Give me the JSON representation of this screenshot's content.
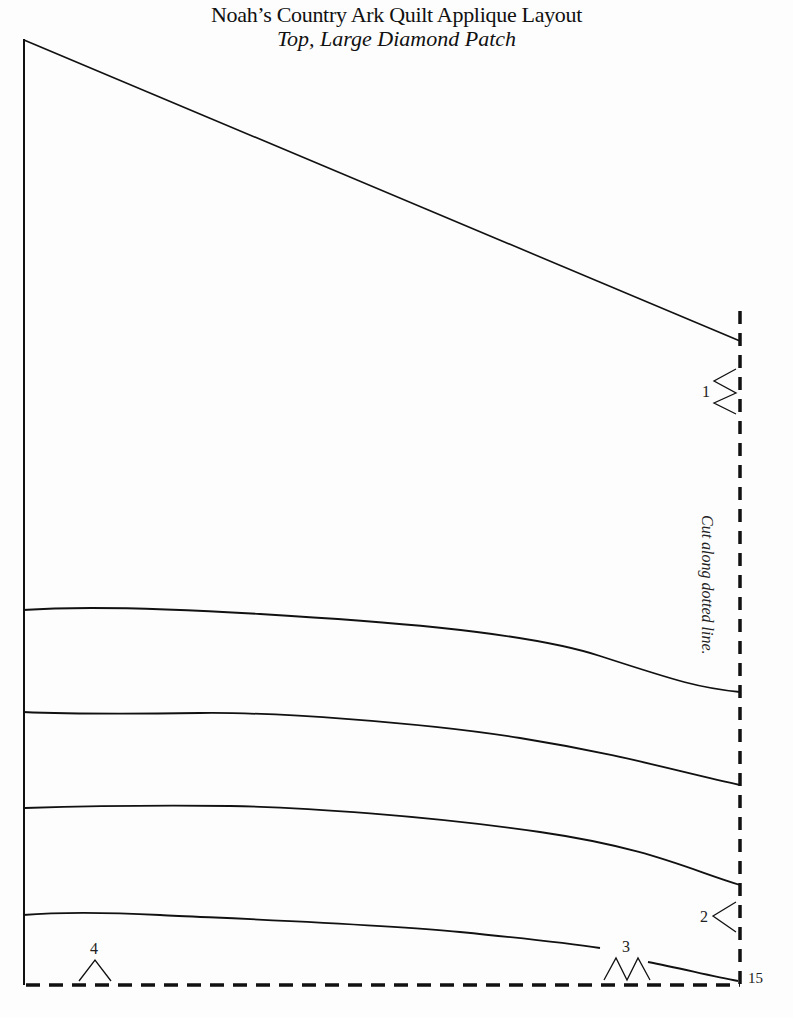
{
  "header": {
    "title": "Noah’s Country Ark Quilt Applique Layout",
    "subtitle": "Top, Large Diamond Patch"
  },
  "pattern": {
    "cut_instruction": "Cut along dotted line.",
    "markers": [
      {
        "id": "1",
        "label": "1",
        "type": "double-notch",
        "edge": "right"
      },
      {
        "id": "2",
        "label": "2",
        "type": "single-notch",
        "edge": "right"
      },
      {
        "id": "3",
        "label": "3",
        "type": "double-notch",
        "edge": "bottom"
      },
      {
        "id": "4",
        "label": "4",
        "type": "single-notch",
        "edge": "bottom"
      }
    ],
    "corner_label": "15",
    "line_color": "#111111"
  }
}
